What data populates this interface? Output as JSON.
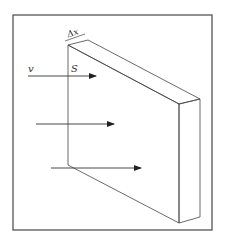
{
  "diagram": {
    "labels": {
      "velocity": "v",
      "surface": "S",
      "thickness": "Δx"
    },
    "colors": {
      "stroke": "#444444",
      "frame": "#555555",
      "arrow": "#222222",
      "background": "#ffffff"
    },
    "arrows_count": 3
  }
}
